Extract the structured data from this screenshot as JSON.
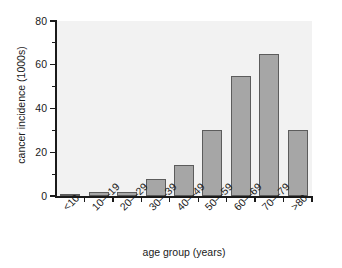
{
  "chart_data": {
    "type": "bar",
    "title": "",
    "subtitle": "",
    "xlabel": "age group (years)",
    "ylabel": "cancer incidence (1000s)",
    "categories": [
      "<10",
      "10—19",
      "20—29",
      "30—39",
      "40—49",
      "50—59",
      "60—69",
      "70—79",
      ">80"
    ],
    "values": [
      1,
      2,
      2,
      8,
      14,
      30,
      55,
      65,
      30
    ],
    "ylim": [
      0,
      80
    ],
    "y_ticks_major": [
      0,
      20,
      40,
      60,
      80
    ],
    "y_tick_labels": [
      "0",
      "20",
      "40",
      "60",
      "80"
    ],
    "y_ticks_minor": [
      10,
      30,
      50,
      70
    ],
    "grid": false,
    "legend": false,
    "legend_position": "none",
    "bar_color": "#a6a6a6",
    "bar_edge_color": "#5c5c5c",
    "plot_background": "#f2f2f2",
    "axis_color": "#1a1a1a",
    "x_label_rotation": -45
  }
}
